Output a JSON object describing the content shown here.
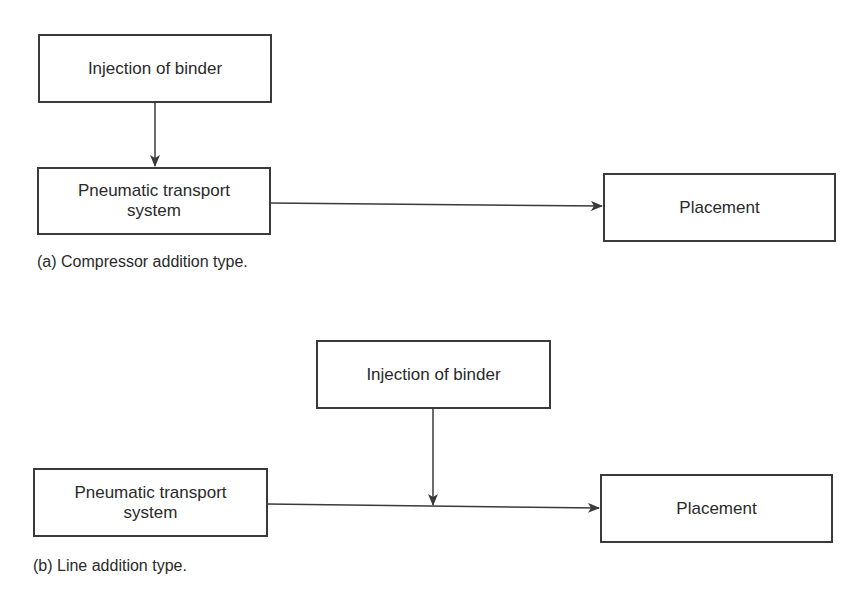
{
  "diagram_a": {
    "injection_box": "Injection of binder",
    "pneumatic_box": {
      "line1": "Pneumatic transport",
      "line2": "system"
    },
    "placement_box": "Placement",
    "caption": "(a) Compressor addition type."
  },
  "diagram_b": {
    "injection_box": "Injection of binder",
    "pneumatic_box": {
      "line1": "Pneumatic transport",
      "line2": "system"
    },
    "placement_box": "Placement",
    "caption": "(b) Line addition type."
  },
  "colors": {
    "stroke": "#3a3a3a",
    "text": "#2a2a2a",
    "background": "#ffffff"
  }
}
